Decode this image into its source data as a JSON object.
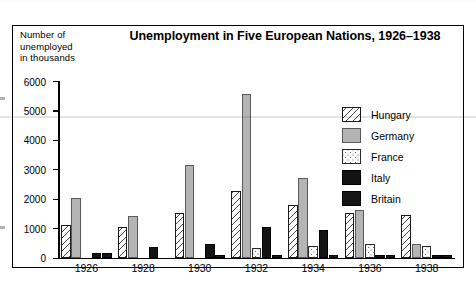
{
  "figure": {
    "title": "Unemployment in Five European Nations, 1926–1938",
    "axis_caption": "Number of\nunemployed\nin thousands"
  },
  "legend": {
    "position": "inside-top-right",
    "entries": [
      {
        "label": "Hungary",
        "pattern": "diagonal-hatch",
        "color": "#ffffff"
      },
      {
        "label": "Germany",
        "pattern": "solid",
        "color": "#b4b4b4"
      },
      {
        "label": "France",
        "pattern": "dotted",
        "color": "#fdfdfd"
      },
      {
        "label": "Italy",
        "pattern": "solid",
        "color": "#131313"
      },
      {
        "label": "Britain",
        "pattern": "solid",
        "color": "#161616"
      }
    ]
  },
  "axes": {
    "y_ticks": [
      "6000",
      "5000",
      "4000",
      "3000",
      "2000",
      "1000",
      "0"
    ],
    "x_ticks": [
      "1926",
      "1928",
      "1930",
      "1932",
      "1934",
      "1936",
      "1938"
    ]
  },
  "chart_data": {
    "type": "bar",
    "title": "Unemployment in Five European Nations, 1926–1938",
    "xlabel": "",
    "ylabel": "Number of unemployed in thousands",
    "ylim": [
      0,
      6000
    ],
    "ytick_step": 1000,
    "grid": false,
    "legend_position": "inside-top-right",
    "categories": [
      "1926",
      "1928",
      "1930",
      "1932",
      "1934",
      "1936",
      "1938"
    ],
    "series": [
      {
        "name": "Hungary",
        "values": [
          1120,
          1050,
          1500,
          2250,
          1800,
          1500,
          1430
        ]
      },
      {
        "name": "Germany",
        "values": [
          2030,
          1400,
          3130,
          5560,
          2700,
          1600,
          450
        ]
      },
      {
        "name": "France",
        "values": [
          0,
          0,
          0,
          330,
          380,
          460,
          390
        ]
      },
      {
        "name": "Italy",
        "values": [
          150,
          370,
          470,
          1050,
          930,
          60,
          50
        ]
      },
      {
        "name": "Britain",
        "values": [
          150,
          0,
          70,
          90,
          50,
          50,
          30
        ]
      }
    ]
  }
}
